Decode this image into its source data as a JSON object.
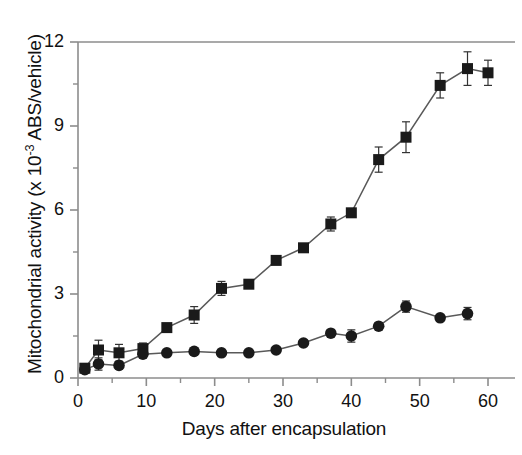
{
  "chart_data": {
    "type": "line",
    "title": "",
    "xlabel": "Days after encapsulation",
    "ylabel_prefix": "Mitochondrial activity (x 10",
    "ylabel_exponent": "-3",
    "ylabel_suffix": " ABS/vehicle)",
    "ylabel_full": "Mitochondrial activity (x 10-3 ABS/vehicle)",
    "xlim": [
      0,
      62
    ],
    "ylim": [
      0,
      12
    ],
    "xticks": [
      0,
      10,
      20,
      30,
      40,
      50,
      60
    ],
    "xtick_labels": [
      "0",
      "10",
      "20",
      "30",
      "40",
      "50",
      "60"
    ],
    "xminor_ticks": [
      5,
      15,
      25,
      35,
      45,
      55
    ],
    "yticks": [
      0,
      3,
      6,
      9,
      12
    ],
    "ytick_labels": [
      "0",
      "3",
      "6",
      "9",
      "12"
    ],
    "yminor_ticks": [
      1.5,
      4.5,
      7.5,
      10.5
    ],
    "grid": false,
    "legend": false,
    "legend_position": "none",
    "marker_color": "#1a1a1a",
    "line_color": "#595959",
    "axis_color": "#8c8c8c",
    "series": [
      {
        "name": "squares",
        "marker": "square",
        "x": [
          1,
          3,
          6,
          9.5,
          13,
          17,
          21,
          25,
          29,
          33,
          37,
          40,
          44,
          48,
          53,
          57,
          60
        ],
        "y": [
          0.35,
          1.0,
          0.9,
          1.05,
          1.8,
          2.25,
          3.2,
          3.35,
          4.2,
          4.65,
          5.5,
          5.9,
          7.8,
          8.6,
          10.45,
          11.05,
          10.9
        ],
        "yerr": [
          0.15,
          0.35,
          0.3,
          0.2,
          0.1,
          0.3,
          0.25,
          0.1,
          0.1,
          0.1,
          0.25,
          0.1,
          0.45,
          0.55,
          0.45,
          0.6,
          0.45
        ]
      },
      {
        "name": "circles",
        "marker": "circle",
        "x": [
          1,
          3,
          6,
          9.5,
          13,
          17,
          21,
          25,
          29,
          33,
          37,
          40,
          44,
          48,
          53,
          57
        ],
        "y": [
          0.3,
          0.5,
          0.45,
          0.85,
          0.9,
          0.95,
          0.9,
          0.9,
          1.0,
          1.25,
          1.6,
          1.5,
          1.85,
          2.55,
          2.15,
          2.3
        ],
        "yerr": [
          0.1,
          0.22,
          0.12,
          0.1,
          0.06,
          0.06,
          0.06,
          0.06,
          0.06,
          0.08,
          0.1,
          0.22,
          0.1,
          0.2,
          0.1,
          0.22
        ]
      }
    ]
  }
}
